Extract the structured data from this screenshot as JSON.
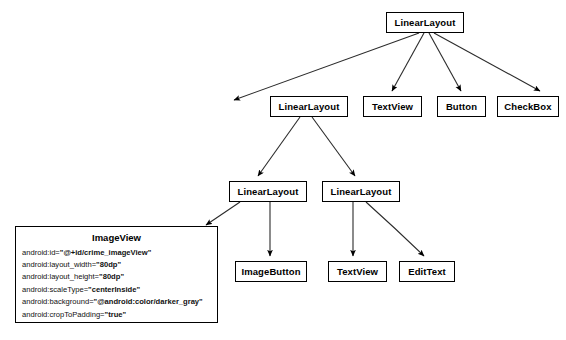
{
  "diagram": {
    "type": "android-view-hierarchy-tree",
    "nodes": [
      {
        "id": "root",
        "label": "LinearLayout",
        "x": 386,
        "y": 12,
        "w": 78,
        "h": 21
      },
      {
        "id": "ll-a",
        "label": "LinearLayout",
        "x": 270,
        "y": 96,
        "w": 78,
        "h": 21
      },
      {
        "id": "textview-1",
        "label": "TextView",
        "x": 363,
        "y": 96,
        "w": 59,
        "h": 21
      },
      {
        "id": "button-1",
        "label": "Button",
        "x": 437,
        "y": 96,
        "w": 49,
        "h": 21
      },
      {
        "id": "checkbox-1",
        "label": "CheckBox",
        "x": 497,
        "y": 96,
        "w": 62,
        "h": 21
      },
      {
        "id": "ll-b",
        "label": "LinearLayout",
        "x": 229,
        "y": 181,
        "w": 78,
        "h": 21
      },
      {
        "id": "ll-c",
        "label": "LinearLayout",
        "x": 322,
        "y": 181,
        "w": 78,
        "h": 21
      },
      {
        "id": "imagebutton",
        "label": "ImageButton",
        "x": 235,
        "y": 261,
        "w": 72,
        "h": 21
      },
      {
        "id": "textview-2",
        "label": "TextView",
        "x": 328,
        "y": 261,
        "w": 59,
        "h": 21
      },
      {
        "id": "edittext",
        "label": "EditText",
        "x": 399,
        "y": 261,
        "w": 56,
        "h": 21
      }
    ],
    "edges": [
      {
        "from": "root",
        "to": "ll-a",
        "d": "M 419 33 L 234 100"
      },
      {
        "from": "root",
        "to": "textview-1",
        "d": "M 424 33 L 392 91"
      },
      {
        "from": "root",
        "to": "button-1",
        "d": "M 429 33 L 461 91"
      },
      {
        "from": "root",
        "to": "checkbox-1",
        "d": "M 434 33 L 540 91"
      },
      {
        "from": "ll-a",
        "to": "ll-b",
        "d": "M 300 117 L 258 176"
      },
      {
        "from": "ll-a",
        "to": "ll-c",
        "d": "M 312 117 L 355 176"
      },
      {
        "from": "ll-b",
        "to": "imageview",
        "d": "M 240 202 L 206 225"
      },
      {
        "from": "ll-b",
        "to": "imagebutton",
        "d": "M 270 202 L 270 256"
      },
      {
        "from": "ll-c",
        "to": "textview-2",
        "d": "M 353 202 L 353 256"
      },
      {
        "from": "ll-c",
        "to": "edittext",
        "d": "M 366 202 Q 395 228 424 256"
      }
    ]
  },
  "imageview_detail": {
    "title": "ImageView",
    "box": {
      "x": 15,
      "y": 226,
      "w": 203,
      "h": 97
    },
    "attributes": [
      {
        "name": "android:id=",
        "value": "\"@+id/crime_imageView\""
      },
      {
        "name": "android:layout_width=",
        "value": "\"80dp\""
      },
      {
        "name": "android:layout_height=",
        "value": "\"80dp\""
      },
      {
        "name": "android:scaleType=",
        "value": "\"centerInside\""
      },
      {
        "name": "android:background=",
        "value": "\"@android:color/darker_gray\""
      },
      {
        "name": "android:cropToPadding=",
        "value": "\"true\""
      }
    ]
  },
  "colors": {
    "stroke": "#000000",
    "background": "#ffffff",
    "text": "#000000"
  }
}
